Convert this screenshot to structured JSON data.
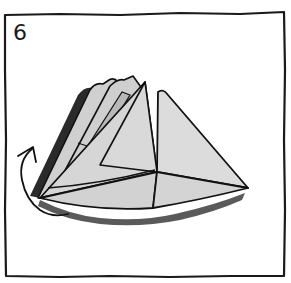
{
  "figure": {
    "type": "origami-instruction-step",
    "step_number": "6",
    "colors": {
      "background": "#ffffff",
      "frame": "#1a1a1a",
      "paper_fill": "#d6d6d6",
      "paper_fill_light": "#dcdcdc",
      "paper_inner_flap": "#b8b8b8",
      "edge_dark": "#2a2a2a",
      "shadow": "#5a5a5a",
      "outline": "#111111"
    },
    "icons": {
      "fold_arrow": "curved-arrow-fold-back"
    }
  }
}
